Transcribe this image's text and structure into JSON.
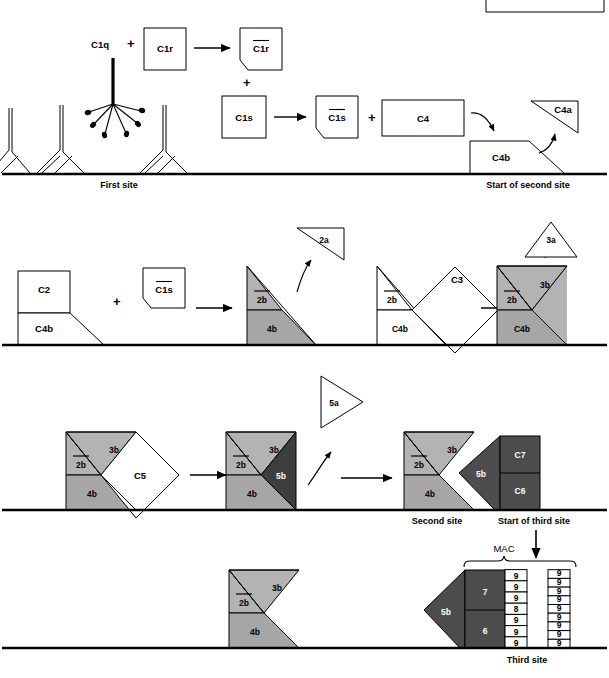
{
  "figure": {
    "background": "#ffffff",
    "stroke": "#000000"
  },
  "colors": {
    "outline": "#000000",
    "fill_white": "#ffffff",
    "fill_light_gray": "#b3b3b3",
    "fill_mid_gray": "#a6a6a6",
    "fill_dark_gray": "#4d4d4d",
    "fill_darker_gray": "#3d3d3d",
    "membrane": "#000000"
  },
  "row1": {
    "c1q_label": "C1q",
    "plus1": "+",
    "c1r_label": "C1r",
    "c1r_active_label": "C1r",
    "c1r_active_bar": "—",
    "plus2": "+",
    "c1s_label": "C1s",
    "c1s_active_label": "C1s",
    "plus3": "+",
    "c4_label": "C4",
    "c4a_label": "C4a",
    "c4b_label": "C4b",
    "site_label": "First site",
    "second_site_label": "Start of second site"
  },
  "row2": {
    "c2_label": "C2",
    "c4b_label": "C4b",
    "plus": "+",
    "c1s_active_label": "C1s",
    "c2a_label": "2a",
    "c2b_label": "2b",
    "c4b_complex_label": "4b",
    "c3_label": "C3",
    "c3a_label": "3a",
    "c3b_label": "3b"
  },
  "row3": {
    "c2b_label": "2b",
    "c3b_label": "3b",
    "c4b_label": "4b",
    "c5_label": "C5",
    "c5a_label": "5a",
    "c5b_label": "5b",
    "second_site_label": "Second site",
    "third_site_label": "Start of third site",
    "c7_label": "C7",
    "c6_label": "C6"
  },
  "row4": {
    "c2b_label": "2b",
    "c3b_label": "3b",
    "c4b_label": "4b",
    "c5b_label": "5b",
    "c7_label": "7",
    "c6_label": "6",
    "mac_label": "MAC",
    "c8_label": "8",
    "c9_label": "9",
    "third_site_label": "Third site",
    "poly_c9_column_1": [
      "9",
      "9",
      "9",
      "8",
      "9",
      "9",
      "9"
    ],
    "poly_c9_column_2": [
      "9",
      "9",
      "9",
      "9",
      "9",
      "9",
      "9",
      "9",
      "9"
    ]
  }
}
